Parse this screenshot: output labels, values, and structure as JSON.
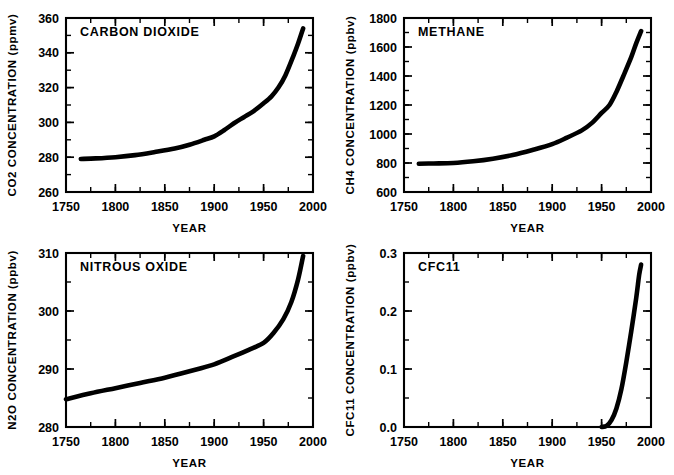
{
  "figure": {
    "background": "#ffffff",
    "ink_color": "#000000",
    "panel_count": 4
  },
  "chart_data": [
    {
      "id": "carbon-dioxide",
      "type": "line",
      "title": "CARBON  DIOXIDE",
      "xlabel": "YEAR",
      "ylabel": "CO2  CONCENTRATION  (ppmv)",
      "xlim": [
        1750,
        2000
      ],
      "ylim": [
        260,
        360
      ],
      "xticks": [
        1750,
        1800,
        1850,
        1900,
        1950,
        2000
      ],
      "xtick_labels": [
        "1750",
        "1800",
        "1850",
        "1900",
        "1950",
        "2000"
      ],
      "xminor_step": 25,
      "yticks": [
        260,
        280,
        300,
        320,
        340,
        360
      ],
      "ytick_labels": [
        "260",
        "280",
        "300",
        "320",
        "340",
        "360"
      ],
      "yminor_step": 10,
      "grid": false,
      "legend": "none",
      "x": [
        1765,
        1780,
        1800,
        1820,
        1840,
        1860,
        1875,
        1890,
        1900,
        1910,
        1920,
        1930,
        1940,
        1950,
        1958,
        1965,
        1972,
        1980,
        1985,
        1990
      ],
      "values": [
        279.0,
        279.3,
        280.0,
        281.2,
        283.0,
        285.0,
        287.2,
        290.0,
        292.0,
        295.5,
        299.5,
        303.0,
        306.5,
        311.0,
        315.0,
        320.0,
        327.0,
        338.0,
        345.5,
        354.0
      ]
    },
    {
      "id": "methane",
      "type": "line",
      "title": "METHANE",
      "xlabel": "YEAR",
      "ylabel": "CH4  CONCENTRATION  (ppbv)",
      "xlim": [
        1750,
        2000
      ],
      "ylim": [
        600,
        1800
      ],
      "xticks": [
        1750,
        1800,
        1850,
        1900,
        1950,
        2000
      ],
      "xtick_labels": [
        "1750",
        "1800",
        "1850",
        "1900",
        "1950",
        "2000"
      ],
      "xminor_step": 25,
      "yticks": [
        600,
        800,
        1000,
        1200,
        1400,
        1600,
        1800
      ],
      "ytick_labels": [
        "600",
        "800",
        "1000",
        "1200",
        "1400",
        "1600",
        "1800"
      ],
      "yminor_step": 100,
      "grid": false,
      "legend": "none",
      "x": [
        1765,
        1780,
        1800,
        1820,
        1840,
        1860,
        1880,
        1900,
        1915,
        1930,
        1940,
        1950,
        1958,
        1965,
        1972,
        1980,
        1985,
        1990
      ],
      "values": [
        795,
        797,
        800,
        812,
        830,
        855,
        890,
        930,
        975,
        1025,
        1075,
        1145,
        1200,
        1290,
        1400,
        1530,
        1625,
        1710
      ]
    },
    {
      "id": "nitrous-oxide",
      "type": "line",
      "title": "NITROUS  OXIDE",
      "xlabel": "YEAR",
      "ylabel": "N2O  CONCENTRATION  (ppbv)",
      "xlim": [
        1750,
        2000
      ],
      "ylim": [
        280,
        310
      ],
      "xticks": [
        1750,
        1800,
        1850,
        1900,
        1950,
        2000
      ],
      "xtick_labels": [
        "1750",
        "1800",
        "1850",
        "1900",
        "1950",
        "2000"
      ],
      "xminor_step": 25,
      "yticks": [
        280,
        290,
        300,
        310
      ],
      "ytick_labels": [
        "280",
        "290",
        "300",
        "310"
      ],
      "yminor_step": 5,
      "grid": false,
      "legend": "none",
      "x": [
        1750,
        1775,
        1800,
        1825,
        1850,
        1875,
        1900,
        1920,
        1935,
        1950,
        1960,
        1970,
        1978,
        1985,
        1990
      ],
      "values": [
        284.8,
        285.8,
        286.7,
        287.6,
        288.5,
        289.6,
        290.8,
        292.2,
        293.3,
        294.5,
        296.2,
        298.6,
        301.5,
        305.5,
        309.5
      ]
    },
    {
      "id": "cfc11",
      "type": "line",
      "title": "CFC11",
      "xlabel": "YEAR",
      "ylabel": "CFC11  CONCENTRATION  (ppbv)",
      "xlim": [
        1750,
        2000
      ],
      "ylim": [
        0.0,
        0.3
      ],
      "xticks": [
        1750,
        1800,
        1850,
        1900,
        1950,
        2000
      ],
      "xtick_labels": [
        "1750",
        "1800",
        "1850",
        "1900",
        "1950",
        "2000"
      ],
      "xminor_step": 25,
      "yticks": [
        0.0,
        0.1,
        0.2,
        0.3
      ],
      "ytick_labels": [
        "0.0",
        "0.1",
        "0.2",
        "0.3"
      ],
      "yminor_step": 0.05,
      "grid": false,
      "legend": "none",
      "x": [
        1950,
        1955,
        1960,
        1965,
        1970,
        1975,
        1980,
        1985,
        1988,
        1990
      ],
      "values": [
        0.0,
        0.002,
        0.012,
        0.032,
        0.065,
        0.112,
        0.165,
        0.222,
        0.262,
        0.28
      ]
    }
  ]
}
